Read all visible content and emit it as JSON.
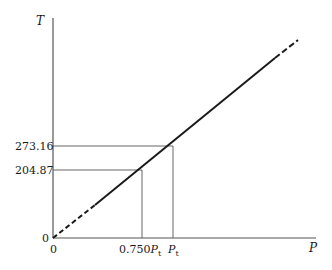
{
  "diagram": {
    "title": "",
    "y_axis": {
      "label": "T"
    },
    "x_axis": {
      "label": "P"
    },
    "y_ticks": [
      "0",
      "204.87",
      "273.16"
    ],
    "x_ticks": [
      "0",
      "0.750",
      "P",
      "t",
      "P",
      "t"
    ],
    "x_tick_labels": {
      "zero": "0",
      "tick1_coef": "0.750",
      "tick1_sym": "P",
      "tick1_sub": "t",
      "tick2_sym": "P",
      "tick2_sub": "t"
    },
    "y_tick_labels": {
      "zero": "0",
      "tick1": "204.87",
      "tick2": "273.16"
    },
    "line": {
      "description": "Straight line through origin; dashed near origin and beyond measured range",
      "color": "#1a1a1a"
    }
  }
}
